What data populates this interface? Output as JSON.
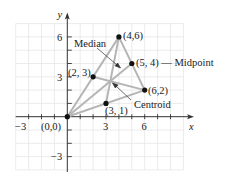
{
  "figure": {
    "axes": {
      "x_label": "x",
      "y_label": "y",
      "x_ticks": [
        {
          "value": -3,
          "label": "−3"
        },
        {
          "value": 3,
          "label": "3"
        },
        {
          "value": 6,
          "label": "6"
        }
      ],
      "y_ticks": [
        {
          "value": 6,
          "label": "6"
        },
        {
          "value": 3,
          "label": "3"
        },
        {
          "value": -3,
          "label": "−3"
        }
      ],
      "grid_x_range": [
        -4,
        9
      ],
      "grid_y_range": [
        -4,
        7
      ]
    },
    "vertices": [
      {
        "x": 0,
        "y": 0,
        "label": "(0,0)"
      },
      {
        "x": 4,
        "y": 6,
        "label": "(4,6)"
      },
      {
        "x": 6,
        "y": 2,
        "label": "(6,2)"
      }
    ],
    "midpoints": [
      {
        "x": 2,
        "y": 3,
        "label": "(2, 3)"
      },
      {
        "x": 5,
        "y": 4,
        "label": "(5, 4) — Midpoint"
      },
      {
        "x": 3,
        "y": 1,
        "label": "(3, 1)"
      }
    ],
    "annotations": {
      "median": "Median",
      "centroid": "Centroid"
    },
    "colors": {
      "grid": "#e6e6e6",
      "axis": "#333333",
      "triangle": "#b5b5b5",
      "point": "#111111"
    }
  }
}
